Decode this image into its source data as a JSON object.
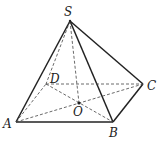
{
  "diagram": {
    "type": "pyramid",
    "points": {
      "S": {
        "label": "S",
        "x": 70,
        "y": 21
      },
      "A": {
        "label": "A",
        "x": 16,
        "y": 122
      },
      "B": {
        "label": "B",
        "x": 113,
        "y": 122
      },
      "C": {
        "label": "C",
        "x": 143,
        "y": 84
      },
      "D": {
        "label": "D",
        "x": 46,
        "y": 84
      },
      "O": {
        "label": "O",
        "x": 79,
        "y": 103
      }
    },
    "solid_edges": [
      [
        "S",
        "A"
      ],
      [
        "S",
        "B"
      ],
      [
        "S",
        "C"
      ],
      [
        "A",
        "B"
      ],
      [
        "B",
        "C"
      ]
    ],
    "dashed_edges": [
      [
        "S",
        "D"
      ],
      [
        "S",
        "O"
      ],
      [
        "A",
        "D"
      ],
      [
        "D",
        "C"
      ],
      [
        "A",
        "C"
      ],
      [
        "D",
        "B"
      ]
    ],
    "line_color": "#222222"
  }
}
